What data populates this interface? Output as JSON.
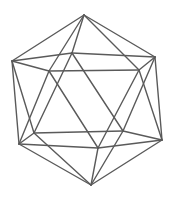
{
  "figure": {
    "background": "#ffffff",
    "stroke_color": "#5a5a5a",
    "vertices": {
      "T": [
        84,
        15
      ],
      "L": [
        12,
        61
      ],
      "BM": [
        72,
        53
      ],
      "FL": [
        49,
        71
      ],
      "FR": [
        139,
        70
      ],
      "R": [
        155,
        57
      ],
      "LL": [
        19,
        144
      ],
      "LB": [
        34,
        133
      ],
      "RB": [
        123,
        131
      ],
      "LR": [
        162,
        140
      ],
      "FM": [
        98,
        148
      ],
      "B": [
        91,
        185
      ]
    },
    "edges": [
      [
        "T",
        "L"
      ],
      [
        "T",
        "BM"
      ],
      [
        "T",
        "FL"
      ],
      [
        "T",
        "FR"
      ],
      [
        "T",
        "R"
      ],
      [
        "L",
        "BM"
      ],
      [
        "BM",
        "R"
      ],
      [
        "L",
        "FL"
      ],
      [
        "FL",
        "FR"
      ],
      [
        "FR",
        "R"
      ],
      [
        "L",
        "LL"
      ],
      [
        "L",
        "LB"
      ],
      [
        "BM",
        "LB"
      ],
      [
        "BM",
        "RB"
      ],
      [
        "R",
        "RB"
      ],
      [
        "R",
        "LR"
      ],
      [
        "FR",
        "LR"
      ],
      [
        "FR",
        "FM"
      ],
      [
        "FL",
        "FM"
      ],
      [
        "FL",
        "LL"
      ],
      [
        "LL",
        "LB"
      ],
      [
        "LB",
        "RB"
      ],
      [
        "RB",
        "LR"
      ],
      [
        "LR",
        "FM"
      ],
      [
        "FM",
        "LL"
      ],
      [
        "B",
        "LL"
      ],
      [
        "B",
        "LB"
      ],
      [
        "B",
        "RB"
      ],
      [
        "B",
        "LR"
      ],
      [
        "B",
        "FM"
      ]
    ]
  }
}
